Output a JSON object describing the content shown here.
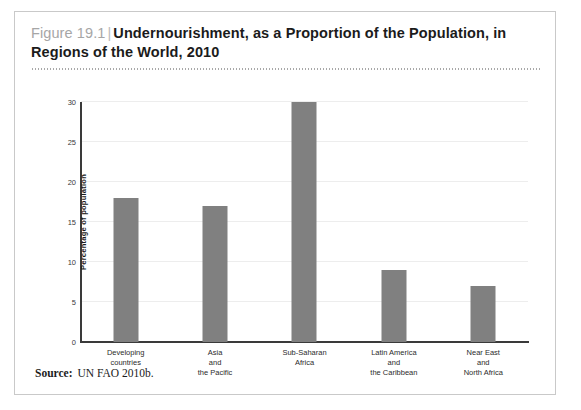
{
  "figure": {
    "number_label": "Figure 19.1",
    "separator": "|",
    "title": "Undernourishment, as a Proportion of the Population, in Regions of the World, 2010",
    "source_label": "Source:",
    "source_text": "UN FAO 2010b."
  },
  "colors": {
    "bar_fill": "#808080",
    "axis": "#3a3a3a",
    "gridline": "#ededed",
    "figure_number": "#a6a6a6",
    "frame_border": "#c9c9c9"
  },
  "chart_data": {
    "type": "bar",
    "title": "Undernourishment, as a Proportion of the Population, in Regions of the World, 2010",
    "xlabel": "",
    "ylabel": "Percentage of population",
    "ylim": [
      0,
      30
    ],
    "yticks": [
      0,
      5,
      10,
      15,
      20,
      25,
      30
    ],
    "ytick_labels": [
      "0",
      "5",
      "10",
      "15",
      "20",
      "25",
      "30"
    ],
    "grid": true,
    "legend": "none",
    "categories": [
      "Developing countries",
      "Asia and the Pacific",
      "Sub-Saharan Africa",
      "Latin America and the Caribbean",
      "Near East and North Africa"
    ],
    "category_lines": [
      [
        "Developing",
        "countries"
      ],
      [
        "Asia",
        "and",
        "the Pacific"
      ],
      [
        "Sub-Saharan",
        "Africa"
      ],
      [
        "Latin America",
        "and",
        "the Caribbean"
      ],
      [
        "Near East",
        "and",
        "North Africa"
      ]
    ],
    "values": [
      18,
      17,
      30,
      9,
      7
    ],
    "series": [
      {
        "name": "Percentage of population undernourished",
        "values": [
          18,
          17,
          30,
          9,
          7
        ]
      }
    ]
  }
}
